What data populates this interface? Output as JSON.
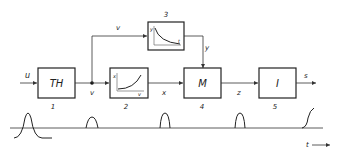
{
  "diagram": {
    "blocks": [
      {
        "id": "1",
        "label": "TH",
        "number": "1"
      },
      {
        "id": "2",
        "label": "",
        "number": "2",
        "inset": {
          "ylabel": "x",
          "xlabel": "v",
          "curve": "increasing"
        }
      },
      {
        "id": "3",
        "label": "",
        "number": "3",
        "inset": {
          "ylabel": "y",
          "xlabel": "t",
          "curve": "decreasing"
        }
      },
      {
        "id": "4",
        "label": "M",
        "number": "4"
      },
      {
        "id": "5",
        "label": "I",
        "number": "5"
      }
    ],
    "signals": {
      "u": "u",
      "v_branch": "v",
      "v_node": "v",
      "x": "x",
      "y": "y",
      "z": "z",
      "s": "s"
    },
    "time_axis_label": "t",
    "waveforms": [
      "pulse",
      "small-pulse",
      "pulse",
      "pulse",
      "rising-edge"
    ]
  }
}
